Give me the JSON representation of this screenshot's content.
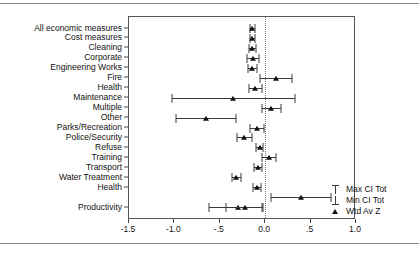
{
  "chart_data": {
    "type": "scatter",
    "title": "",
    "xlabel": "",
    "ylabel": "",
    "xlim": [
      -1.5,
      1.0
    ],
    "xticks": [
      -1.5,
      -1.0,
      -0.5,
      0.0,
      0.5,
      1.0
    ],
    "xticklabels": [
      "-1.5",
      "-1.0",
      "-.5",
      "0.0",
      ".5",
      "1.0"
    ],
    "grid": false,
    "reference_line": 0.0,
    "legend_position": "right-bottom",
    "legend": [
      {
        "key": "max-ci-tot",
        "label": "Max CI Tot",
        "marker": "upper-cap"
      },
      {
        "key": "min-ci-tot",
        "label": "Min CI Tot",
        "marker": "lower-cap"
      },
      {
        "key": "wtd-av-z",
        "label": "Wtd Av Z",
        "marker": "triangle"
      }
    ],
    "series_names": [
      "Wtd Av Z",
      "Min CI Tot",
      "Max CI Tot"
    ],
    "categories": [
      "All economic measures",
      "Cost measures",
      "Cleaning",
      "Corporate",
      "Engineering Works",
      "Fire",
      "Health",
      "Maintenance",
      "Multiple",
      "Other",
      "Parks/Recreation",
      "Police/Security",
      "Refuse",
      "Training",
      "Transport",
      "Water Treatment",
      "Health",
      "",
      "Productivity"
    ],
    "points": [
      {
        "category": "All economic measures",
        "value": -0.14,
        "min": -0.17,
        "max": -0.11
      },
      {
        "category": "Cost measures",
        "value": -0.14,
        "min": -0.17,
        "max": -0.11
      },
      {
        "category": "Cleaning",
        "value": -0.14,
        "min": -0.18,
        "max": -0.1
      },
      {
        "category": "Corporate",
        "value": -0.13,
        "min": -0.2,
        "max": -0.07
      },
      {
        "category": "Engineering Works",
        "value": -0.14,
        "min": -0.19,
        "max": -0.09
      },
      {
        "category": "Fire",
        "value": 0.12,
        "min": -0.06,
        "max": 0.3
      },
      {
        "category": "Health",
        "value": -0.11,
        "min": -0.18,
        "max": -0.04
      },
      {
        "category": "Maintenance",
        "value": -0.35,
        "min": -1.03,
        "max": 0.33
      },
      {
        "category": "Multiple",
        "value": 0.06,
        "min": -0.04,
        "max": 0.17
      },
      {
        "category": "Other",
        "value": -0.65,
        "min": -0.98,
        "max": -0.32
      },
      {
        "category": "Parks/Recreation",
        "value": -0.09,
        "min": -0.17,
        "max": -0.01
      },
      {
        "category": "Police/Security",
        "value": -0.23,
        "min": -0.31,
        "max": -0.15
      },
      {
        "category": "Refuse",
        "value": -0.06,
        "min": -0.1,
        "max": -0.02
      },
      {
        "category": "Training",
        "value": 0.04,
        "min": -0.03,
        "max": 0.12
      },
      {
        "category": "Transport",
        "value": -0.08,
        "min": -0.12,
        "max": -0.03
      },
      {
        "category": "Water Treatment",
        "value": -0.32,
        "min": -0.37,
        "max": -0.27
      },
      {
        "category": "Health",
        "value": -0.09,
        "min": -0.13,
        "max": -0.05
      },
      {
        "category": "Water Treatment 2",
        "value": 0.39,
        "min": 0.06,
        "max": 0.72
      },
      {
        "category": "Health 2",
        "value": -0.3,
        "min": -0.62,
        "max": -0.03
      },
      {
        "category": "Productivity",
        "value": -0.22,
        "min": -0.43,
        "max": -0.02
      }
    ]
  }
}
